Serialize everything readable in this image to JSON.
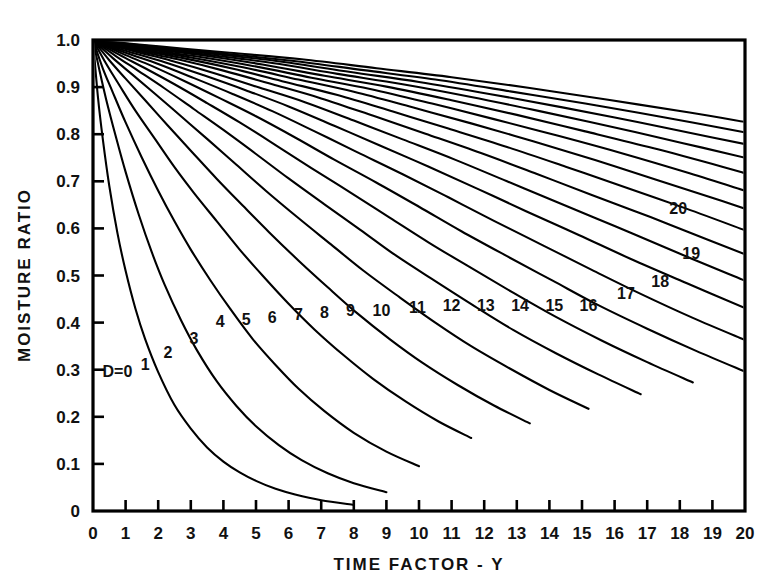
{
  "chart_data": {
    "type": "line",
    "title": "",
    "xlabel": "TIME FACTOR - Y",
    "ylabel": "MOISTURE RATIO",
    "xlim": [
      0,
      20
    ],
    "ylim": [
      0,
      1.0
    ],
    "grid": false,
    "legend": "inline-curve-labels",
    "x_ticks": [
      "0",
      "1",
      "2",
      "3",
      "4",
      "5",
      "6",
      "7",
      "8",
      "9",
      "10",
      "11",
      "12",
      "13",
      "14",
      "15",
      "16",
      "17",
      "18",
      "19",
      "20"
    ],
    "y_ticks": [
      "0",
      "0.1",
      "0.2",
      "0.3",
      "0.4",
      "0.5",
      "0.6",
      "0.7",
      "0.8",
      "0.9",
      "1.0"
    ],
    "first_curve_label": "D=0",
    "series": [
      {
        "name": "D=0",
        "label": "D=0",
        "label_x": 0.75,
        "label_y": 0.285,
        "points_x": [
          0,
          0.15,
          0.3,
          0.5,
          0.75,
          1.0,
          1.3,
          1.6,
          2.0,
          2.5,
          3.0,
          3.5,
          4.0,
          4.5,
          5.0,
          5.6,
          6.2,
          7.0,
          8.0
        ],
        "points_y": [
          1.0,
          0.88,
          0.79,
          0.69,
          0.59,
          0.51,
          0.43,
          0.365,
          0.295,
          0.225,
          0.175,
          0.135,
          0.105,
          0.082,
          0.064,
          0.047,
          0.035,
          0.023,
          0.013
        ]
      },
      {
        "name": "1",
        "label": "1",
        "label_x": 1.6,
        "label_y": 0.3,
        "points_x": [
          0,
          0.2,
          0.4,
          0.7,
          1.0,
          1.4,
          1.8,
          2.2,
          2.7,
          3.2,
          3.8,
          4.4,
          5.0,
          5.7,
          6.4,
          7.2,
          8.0,
          9.0
        ],
        "points_y": [
          1.0,
          0.935,
          0.875,
          0.795,
          0.72,
          0.63,
          0.55,
          0.48,
          0.405,
          0.34,
          0.275,
          0.223,
          0.18,
          0.14,
          0.108,
          0.08,
          0.059,
          0.04
        ]
      },
      {
        "name": "2",
        "label": "2",
        "label_x": 2.3,
        "label_y": 0.325,
        "points_x": [
          0,
          0.3,
          0.6,
          1.0,
          1.5,
          2.0,
          2.5,
          3.0,
          3.6,
          4.2,
          4.9,
          5.6,
          6.3,
          7.1,
          8.0,
          9.0,
          10.0
        ],
        "points_y": [
          1.0,
          0.94,
          0.89,
          0.825,
          0.75,
          0.68,
          0.615,
          0.555,
          0.49,
          0.43,
          0.365,
          0.31,
          0.26,
          0.212,
          0.166,
          0.126,
          0.095
        ]
      },
      {
        "name": "3",
        "label": "3",
        "label_x": 3.1,
        "label_y": 0.355,
        "points_x": [
          0,
          0.4,
          0.8,
          1.3,
          1.9,
          2.5,
          3.1,
          3.8,
          4.5,
          5.2,
          6.0,
          6.8,
          7.7,
          8.6,
          9.6,
          10.6,
          11.6
        ],
        "points_y": [
          1.0,
          0.95,
          0.905,
          0.85,
          0.79,
          0.73,
          0.675,
          0.615,
          0.555,
          0.5,
          0.44,
          0.385,
          0.33,
          0.28,
          0.232,
          0.19,
          0.155
        ]
      },
      {
        "name": "4",
        "label": "4",
        "label_x": 3.9,
        "label_y": 0.39,
        "points_x": [
          0,
          0.5,
          1.0,
          1.6,
          2.3,
          3.0,
          3.8,
          4.6,
          5.4,
          6.3,
          7.2,
          8.1,
          9.1,
          10.1,
          11.2,
          12.3,
          13.4
        ],
        "points_y": [
          1.0,
          0.957,
          0.918,
          0.872,
          0.818,
          0.765,
          0.705,
          0.648,
          0.592,
          0.532,
          0.475,
          0.42,
          0.365,
          0.315,
          0.267,
          0.224,
          0.186
        ]
      },
      {
        "name": "5",
        "label": "5",
        "label_x": 4.7,
        "label_y": 0.395,
        "points_x": [
          0,
          0.6,
          1.2,
          1.9,
          2.7,
          3.5,
          4.4,
          5.3,
          6.3,
          7.3,
          8.3,
          9.4,
          10.5,
          11.6,
          12.8,
          14.0,
          15.2
        ],
        "points_y": [
          1.0,
          0.962,
          0.927,
          0.886,
          0.838,
          0.79,
          0.735,
          0.68,
          0.622,
          0.566,
          0.51,
          0.454,
          0.4,
          0.35,
          0.302,
          0.257,
          0.217
        ]
      },
      {
        "name": "6",
        "label": "6",
        "label_x": 5.5,
        "label_y": 0.4,
        "points_x": [
          0,
          0.7,
          1.4,
          2.2,
          3.1,
          4.0,
          5.0,
          6.0,
          7.1,
          8.2,
          9.3,
          10.5,
          11.7,
          12.9,
          14.2,
          15.5,
          16.8
        ],
        "points_y": [
          1.0,
          0.966,
          0.934,
          0.897,
          0.853,
          0.809,
          0.758,
          0.706,
          0.651,
          0.597,
          0.542,
          0.488,
          0.435,
          0.384,
          0.335,
          0.29,
          0.248
        ]
      },
      {
        "name": "7",
        "label": "7",
        "label_x": 6.3,
        "label_y": 0.405,
        "points_x": [
          0,
          0.8,
          1.6,
          2.5,
          3.5,
          4.5,
          5.6,
          6.7,
          7.9,
          9.1,
          10.3,
          11.6,
          12.9,
          14.2,
          15.6,
          17.0,
          18.4
        ],
        "points_y": [
          1.0,
          0.969,
          0.94,
          0.906,
          0.866,
          0.825,
          0.777,
          0.728,
          0.676,
          0.623,
          0.57,
          0.516,
          0.463,
          0.412,
          0.362,
          0.316,
          0.273
        ]
      },
      {
        "name": "8",
        "label": "8",
        "label_x": 7.1,
        "label_y": 0.41,
        "points_x": [
          0,
          0.9,
          1.8,
          2.8,
          3.9,
          5.0,
          6.2,
          7.4,
          8.7,
          10.0,
          11.3,
          12.7,
          14.1,
          15.5,
          17.0,
          18.5,
          20.0
        ],
        "points_y": [
          1.0,
          0.971,
          0.945,
          0.913,
          0.876,
          0.838,
          0.793,
          0.746,
          0.697,
          0.646,
          0.594,
          0.541,
          0.489,
          0.437,
          0.387,
          0.34,
          0.296
        ]
      },
      {
        "name": "9",
        "label": "9",
        "label_x": 7.9,
        "label_y": 0.415,
        "points_x": [
          0,
          1.0,
          2.0,
          3.1,
          4.3,
          5.5,
          6.8,
          8.1,
          9.5,
          10.9,
          12.3,
          13.8,
          15.3,
          16.8,
          18.4,
          20.0
        ],
        "points_y": [
          1.0,
          0.973,
          0.949,
          0.919,
          0.885,
          0.849,
          0.806,
          0.762,
          0.715,
          0.666,
          0.616,
          0.564,
          0.512,
          0.461,
          0.41,
          0.363
        ]
      },
      {
        "name": "10",
        "label": "10",
        "label_x": 8.85,
        "label_y": 0.415,
        "points_x": [
          0,
          1.1,
          2.2,
          3.4,
          4.7,
          6.0,
          7.4,
          8.8,
          10.3,
          11.8,
          13.3,
          14.9,
          16.5,
          18.2,
          20.0
        ],
        "points_y": [
          1.0,
          0.975,
          0.953,
          0.925,
          0.893,
          0.859,
          0.818,
          0.776,
          0.731,
          0.684,
          0.636,
          0.586,
          0.535,
          0.484,
          0.431
        ]
      },
      {
        "name": "11",
        "label": "11",
        "label_x": 9.95,
        "label_y": 0.42,
        "points_x": [
          0,
          1.2,
          2.4,
          3.7,
          5.1,
          6.5,
          8.0,
          9.5,
          11.1,
          12.7,
          14.3,
          16.0,
          17.7,
          19.5,
          20.0
        ],
        "points_y": [
          1.0,
          0.977,
          0.956,
          0.93,
          0.899,
          0.868,
          0.829,
          0.789,
          0.746,
          0.7,
          0.654,
          0.605,
          0.555,
          0.503,
          0.489
        ]
      },
      {
        "name": "12",
        "label": "12",
        "label_x": 11.0,
        "label_y": 0.425,
        "points_x": [
          0,
          1.3,
          2.6,
          4.0,
          5.5,
          7.0,
          8.6,
          10.2,
          11.9,
          13.6,
          15.3,
          17.1,
          18.9,
          20.0
        ],
        "points_y": [
          1.0,
          0.978,
          0.959,
          0.935,
          0.906,
          0.876,
          0.839,
          0.801,
          0.76,
          0.716,
          0.671,
          0.624,
          0.575,
          0.545
        ]
      },
      {
        "name": "13",
        "label": "13",
        "label_x": 12.05,
        "label_y": 0.425,
        "points_x": [
          0,
          1.4,
          2.8,
          4.3,
          5.9,
          7.5,
          9.2,
          10.9,
          12.7,
          14.5,
          16.3,
          18.2,
          20.0
        ],
        "points_y": [
          1.0,
          0.979,
          0.961,
          0.939,
          0.911,
          0.883,
          0.848,
          0.812,
          0.773,
          0.731,
          0.688,
          0.642,
          0.596
        ]
      },
      {
        "name": "14",
        "label": "14",
        "label_x": 13.1,
        "label_y": 0.425,
        "points_x": [
          0,
          1.5,
          3.0,
          4.6,
          6.3,
          8.0,
          9.8,
          11.6,
          13.5,
          15.4,
          17.3,
          19.3,
          20.0
        ],
        "points_y": [
          1.0,
          0.98,
          0.963,
          0.942,
          0.916,
          0.89,
          0.857,
          0.823,
          0.785,
          0.745,
          0.703,
          0.658,
          0.642
        ]
      },
      {
        "name": "15",
        "label": "15",
        "label_x": 14.15,
        "label_y": 0.425,
        "points_x": [
          0,
          1.6,
          3.2,
          4.9,
          6.7,
          8.5,
          10.4,
          12.3,
          14.3,
          16.3,
          18.3,
          20.0
        ],
        "points_y": [
          1.0,
          0.981,
          0.965,
          0.945,
          0.92,
          0.896,
          0.865,
          0.832,
          0.796,
          0.758,
          0.717,
          0.68
        ]
      },
      {
        "name": "16",
        "label": "16",
        "label_x": 15.2,
        "label_y": 0.425,
        "points_x": [
          0,
          1.7,
          3.4,
          5.2,
          7.1,
          9.0,
          11.0,
          13.0,
          15.1,
          17.2,
          19.3,
          20.0
        ],
        "points_y": [
          1.0,
          0.982,
          0.967,
          0.948,
          0.924,
          0.901,
          0.872,
          0.841,
          0.806,
          0.77,
          0.731,
          0.717
        ]
      },
      {
        "name": "17",
        "label": "17",
        "label_x": 16.35,
        "label_y": 0.45,
        "points_x": [
          0,
          1.8,
          3.6,
          5.5,
          7.5,
          9.5,
          11.6,
          13.7,
          15.9,
          18.1,
          20.0
        ],
        "points_y": [
          1.0,
          0.983,
          0.968,
          0.951,
          0.928,
          0.906,
          0.879,
          0.849,
          0.816,
          0.781,
          0.75
        ]
      },
      {
        "name": "18",
        "label": "18",
        "label_x": 17.4,
        "label_y": 0.475,
        "points_x": [
          0,
          1.9,
          3.8,
          5.8,
          7.9,
          10.0,
          12.2,
          14.4,
          16.7,
          19.0,
          20.0
        ],
        "points_y": [
          1.0,
          0.984,
          0.97,
          0.954,
          0.932,
          0.911,
          0.885,
          0.857,
          0.826,
          0.793,
          0.779
        ]
      },
      {
        "name": "19",
        "label": "19",
        "label_x": 18.35,
        "label_y": 0.535,
        "points_x": [
          0,
          2.0,
          4.0,
          6.1,
          8.3,
          10.5,
          12.8,
          15.1,
          17.5,
          19.9,
          20.0
        ],
        "points_y": [
          1.0,
          0.985,
          0.971,
          0.956,
          0.936,
          0.916,
          0.891,
          0.865,
          0.836,
          0.805,
          0.804
        ]
      },
      {
        "name": "20",
        "label": "20",
        "label_x": 17.95,
        "label_y": 0.63,
        "points_x": [
          0,
          2.1,
          4.2,
          6.4,
          8.7,
          11.0,
          13.4,
          15.8,
          18.3,
          20.0
        ],
        "points_y": [
          1.0,
          0.986,
          0.973,
          0.959,
          0.94,
          0.921,
          0.898,
          0.873,
          0.846,
          0.826
        ]
      }
    ]
  },
  "colors": {
    "line": "#000000",
    "axis": "#000000",
    "background": "#ffffff"
  }
}
